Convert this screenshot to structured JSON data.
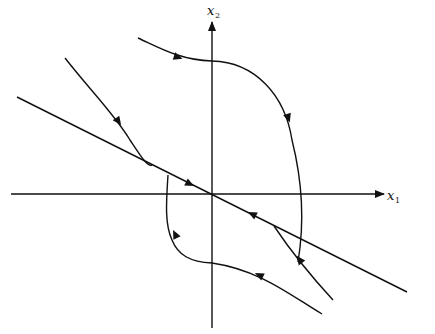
{
  "diagram": {
    "axes": {
      "horizontal": {
        "label": "x",
        "subscript": "1"
      },
      "vertical": {
        "label": "x",
        "subscript": "2"
      }
    },
    "colors": {
      "ink": "#111111",
      "background": "#ffffff"
    },
    "elements": [
      {
        "name": "x1-axis",
        "type": "axis-arrow"
      },
      {
        "name": "x2-axis",
        "type": "axis-arrow"
      },
      {
        "name": "eigenvector-line",
        "type": "straight-line",
        "arrows": [
          "toward origin from upper-left",
          "toward origin from lower-right"
        ]
      },
      {
        "name": "trajectory-top",
        "type": "curve",
        "direction": "clockwise, from upper-left over top, down right side to eigen line"
      },
      {
        "name": "trajectory-upper-left",
        "type": "curve",
        "direction": "downward toward eigen line"
      },
      {
        "name": "trajectory-bottom",
        "type": "curve",
        "direction": "from lower-right leftward, up left side to eigen line"
      },
      {
        "name": "trajectory-lower-right",
        "type": "curve",
        "direction": "upward toward eigen line"
      }
    ]
  }
}
